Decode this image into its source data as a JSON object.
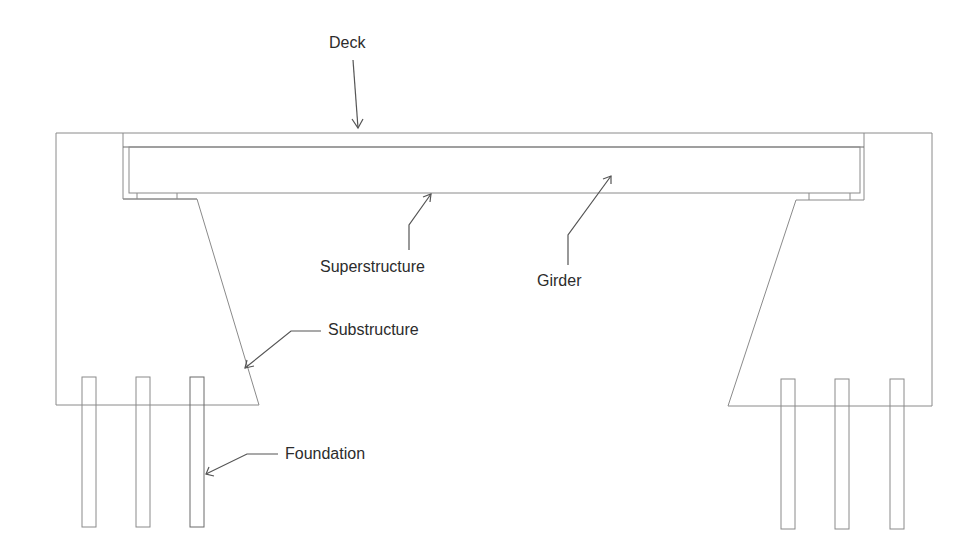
{
  "diagram": {
    "type": "bridge-cross-section",
    "labels": {
      "deck": "Deck",
      "superstructure": "Superstructure",
      "girder": "Girder",
      "substructure": "Substructure",
      "foundation": "Foundation"
    },
    "colors": {
      "background": "#ffffff",
      "line": "#8a8a8a",
      "leader": "#555555",
      "text": "#2c2c2c"
    }
  }
}
